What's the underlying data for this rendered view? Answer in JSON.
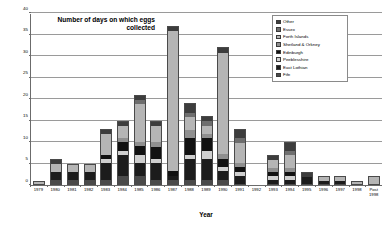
{
  "chart_data": {
    "type": "bar",
    "title": "Number of days on which eggs collected",
    "xlabel": "Year",
    "ylabel": "",
    "ylim": [
      0,
      40
    ],
    "yticks": [
      0,
      5,
      10,
      15,
      20,
      25,
      30,
      35,
      40
    ],
    "grid": true,
    "stacked": true,
    "legend_position": "top-right",
    "categories": [
      "1979",
      "1980",
      "1981",
      "1982",
      "1983",
      "1984",
      "1985",
      "1986",
      "1987",
      "1988",
      "1989",
      "1990",
      "1991",
      "1992",
      "1993",
      "1994",
      "1995",
      "1996",
      "1997",
      "1998",
      "Post\n1998"
    ],
    "series": [
      {
        "name": "Fife",
        "color": "#4a4a4a",
        "values": [
          0,
          1,
          1,
          1,
          1,
          2,
          2,
          1,
          1,
          1,
          1,
          1,
          0,
          0,
          0,
          0,
          0,
          0,
          0,
          0,
          0
        ]
      },
      {
        "name": "East Lothian",
        "color": "#1c1c1c",
        "values": [
          0,
          2,
          2,
          2,
          4,
          5,
          3,
          4,
          1,
          5,
          5,
          2,
          2,
          0,
          1,
          1,
          2,
          1,
          1,
          0,
          0
        ]
      },
      {
        "name": "Peeblesshire",
        "color": "#cfcfcf",
        "values": [
          0,
          0,
          0,
          0,
          1,
          1,
          2,
          1,
          0,
          1,
          2,
          1,
          1,
          0,
          1,
          1,
          0,
          0,
          0,
          0,
          0
        ]
      },
      {
        "name": "Edinburgh",
        "color": "#111111",
        "values": [
          0,
          0,
          0,
          0,
          1,
          2,
          2,
          3,
          1,
          4,
          3,
          2,
          1,
          0,
          1,
          1,
          0,
          0,
          0,
          0,
          0
        ]
      },
      {
        "name": "Shetland & Orkney",
        "color": "#8f8f8f",
        "values": [
          0,
          0,
          0,
          0,
          0,
          1,
          1,
          1,
          0,
          2,
          1,
          1,
          1,
          0,
          1,
          1,
          0,
          0,
          0,
          0,
          0
        ]
      },
      {
        "name": "Forth Islands",
        "color": "#b5b5b5",
        "values": [
          1,
          2,
          2,
          2,
          5,
          3,
          9,
          4,
          33,
          3,
          2,
          24,
          5,
          0,
          2,
          3,
          0,
          1,
          1,
          1,
          2
        ]
      },
      {
        "name": "Essex",
        "color": "#6e6e6e",
        "values": [
          0,
          0,
          0,
          0,
          0,
          0,
          1,
          0,
          0,
          1,
          1,
          0,
          1,
          0,
          0,
          1,
          0,
          0,
          0,
          0,
          0
        ]
      },
      {
        "name": "Other",
        "color": "#3d3d3d",
        "values": [
          0,
          1,
          0,
          0,
          1,
          1,
          1,
          1,
          1,
          2,
          1,
          1,
          2,
          0,
          1,
          2,
          1,
          0,
          0,
          0,
          0
        ]
      }
    ],
    "totals": [
      1,
      6,
      5,
      5,
      13,
      15,
      21,
      15,
      37,
      19,
      16,
      32,
      13,
      0,
      7,
      10,
      3,
      2,
      2,
      1,
      2
    ]
  },
  "legend": {
    "entries": [
      {
        "label": "Other"
      },
      {
        "label": "Essex"
      },
      {
        "label": "Forth Islands"
      },
      {
        "label": "Shetland & Orkney"
      },
      {
        "label": "Edinburgh"
      },
      {
        "label": "Peeblesshire"
      },
      {
        "label": "East Lothian"
      },
      {
        "label": "Fife"
      }
    ]
  }
}
